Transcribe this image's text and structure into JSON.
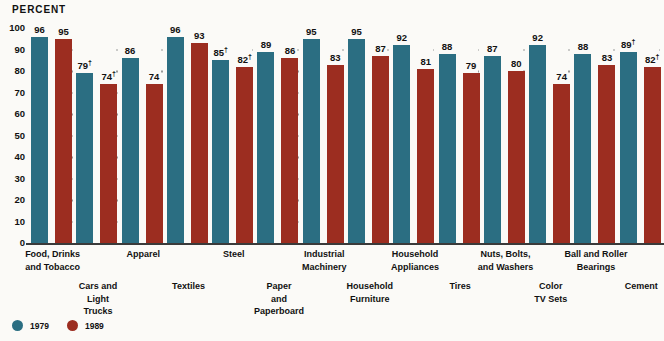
{
  "header": {
    "axis_unit_label": "PERCENT"
  },
  "legend": {
    "items": [
      {
        "label": "1979",
        "color": "#2b6e82",
        "marker": "circle-marker"
      },
      {
        "label": "1989",
        "color": "#9c2d20",
        "marker": "circle-marker"
      }
    ]
  },
  "chart_data": {
    "type": "bar",
    "title": "",
    "subtitle": "",
    "xlabel": "",
    "ylabel": "PERCENT",
    "ylim": [
      0,
      100
    ],
    "yticks": [
      0,
      10,
      20,
      30,
      40,
      50,
      60,
      70,
      80,
      90,
      100
    ],
    "grid": "dotted-horizontal",
    "legend_position": "bottom-left",
    "categories": [
      "Food, Drinks\nand Tobacco",
      "Cars and\nLight\nTrucks",
      "Apparel",
      "Textiles",
      "Steel",
      "Paper\nand\nPaperboard",
      "Industrial\nMachinery",
      "Household\nFurniture",
      "Household\nAppliances",
      "Tires",
      "Nuts, Bolts,\nand Washers",
      "Color\nTV Sets",
      "Ball and Roller\nBearings",
      "Cement"
    ],
    "series": [
      {
        "name": "1979",
        "color": "#2b6e82",
        "values": [
          96,
          79,
          86,
          96,
          85,
          89,
          95,
          95,
          92,
          88,
          87,
          92,
          88,
          89
        ],
        "labels": [
          "96",
          "79†",
          "86",
          "96",
          "85†",
          "89",
          "95",
          "95",
          "92",
          "88",
          "87",
          "92",
          "88",
          "89†"
        ]
      },
      {
        "name": "1989",
        "color": "#9c2d20",
        "values": [
          95,
          74,
          74,
          93,
          82,
          86,
          83,
          87,
          81,
          79,
          80,
          74,
          83,
          82
        ],
        "labels": [
          "95",
          "74†",
          "74",
          "93",
          "82†",
          "86",
          "83",
          "87",
          "81",
          "79",
          "80",
          "74",
          "83",
          "82†"
        ]
      }
    ],
    "footnote_symbol": "†"
  }
}
